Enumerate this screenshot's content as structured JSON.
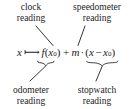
{
  "figure": {
    "background": "#ffffff",
    "ink": "#1d1d1d"
  },
  "labels": {
    "clock": {
      "line1": "clock",
      "line2": "reading"
    },
    "speedometer": {
      "line1": "speedometer",
      "line2": "reading"
    },
    "odometer": {
      "line1": "odometer",
      "line2": "reading"
    },
    "stopwatch": {
      "line1": "stopwatch",
      "line2": "reading"
    }
  },
  "formula": {
    "full_text": "x ↦ f(x₀) + m · (x − x₀)",
    "variable": "x",
    "mapsto": "⟼",
    "function_name": "f",
    "paren_open": "(",
    "paren_close": ")",
    "base_point": "x",
    "base_point_sub": "0",
    "plus": "+",
    "slope": "m",
    "cdot": "·",
    "minus": "−"
  },
  "annotations": {
    "clock_points_to": "x₀ inside f(x₀)",
    "speedometer_points_to": "m",
    "odometer_brace_under": "f(x₀)",
    "stopwatch_brace_under": "(x − x₀)"
  }
}
